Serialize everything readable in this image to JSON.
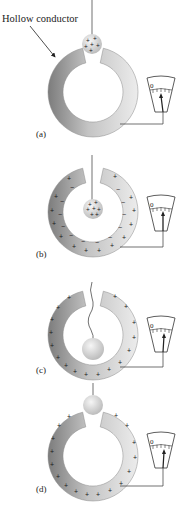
{
  "figure": {
    "annotation": "Hollow conductor",
    "meter_zero_label": "0",
    "panels": [
      {
        "id": "a",
        "label": "(a)",
        "ball_charge": "+",
        "ring_inner_charge": "",
        "ring_outer_charge": "",
        "ball_position": "above-opening"
      },
      {
        "id": "b",
        "label": "(b)",
        "ball_charge": "+",
        "ring_inner_charge": "-",
        "ring_outer_charge": "+",
        "ball_position": "inside"
      },
      {
        "id": "c",
        "label": "(c)",
        "ball_charge": "",
        "ring_inner_charge": "",
        "ring_outer_charge": "+",
        "ball_position": "touching-inside"
      },
      {
        "id": "d",
        "label": "(d)",
        "ball_charge": "",
        "ring_inner_charge": "",
        "ring_outer_charge": "+",
        "ball_position": "removed-above"
      }
    ],
    "colors": {
      "ring_dark": "#7a7a7a",
      "ring_light": "#e6e6e6",
      "ball_light": "#f2f2f2",
      "ball_dark": "#bdbdbd",
      "line": "#333333"
    }
  }
}
